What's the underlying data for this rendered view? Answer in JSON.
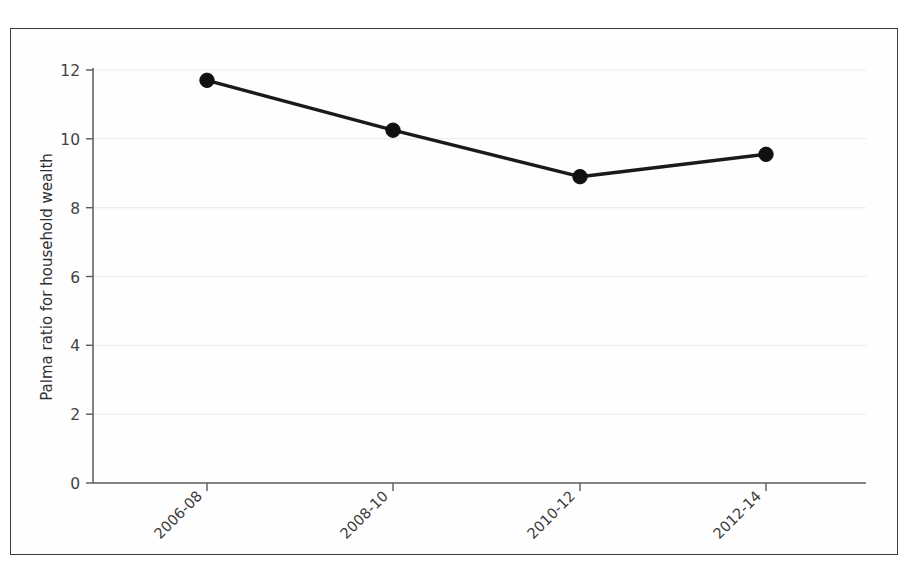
{
  "chart_data": {
    "type": "line",
    "title": "",
    "subtitle": "",
    "xlabel": "",
    "ylabel": "Palma ratio for household wealth",
    "categories": [
      "2006-08",
      "2008-10",
      "2010-12",
      "2012-14"
    ],
    "values": [
      11.7,
      10.25,
      8.9,
      9.55
    ],
    "series": [
      {
        "name": "Palma ratio for household wealth",
        "values": [
          11.7,
          10.25,
          8.9,
          9.55
        ]
      }
    ],
    "ylim": [
      0,
      12
    ],
    "xlim_categories": 4,
    "yticks": [
      0,
      2,
      4,
      6,
      8,
      10,
      12
    ],
    "ytick_labels": [
      "0",
      "2",
      "4",
      "6",
      "8",
      "10",
      "12"
    ],
    "xtick_labels": [
      "2006-08",
      "2008-10",
      "2010-12",
      "2012-14"
    ],
    "xtick_rotation_degrees": 45,
    "grid": {
      "horizontal": true,
      "vertical": false,
      "color": "#e9e9ee"
    },
    "legend": {
      "visible": false,
      "position": "none",
      "entries": []
    },
    "marker": {
      "shape": "circle",
      "filled": true,
      "color": "#111111"
    },
    "line_color": "#1a1a1a",
    "background_color": "#ffffff",
    "border_color": "#3b3b3b",
    "annotations": []
  },
  "figure": {
    "caption_fragment": ""
  }
}
